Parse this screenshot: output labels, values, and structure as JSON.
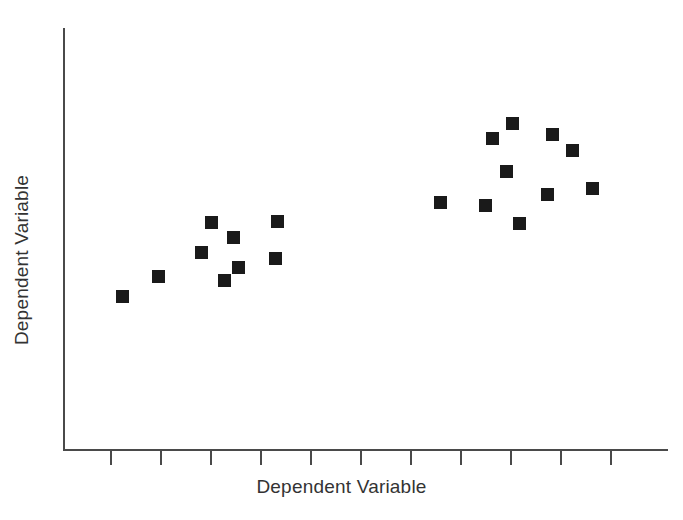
{
  "chart_data": {
    "type": "scatter",
    "title": "",
    "subtitle": "",
    "xlabel": "Dependent Variable",
    "ylabel": "Dependent Variable",
    "xlim": [
      0,
      12
    ],
    "ylim": [
      0,
      10
    ],
    "grid": false,
    "legend": null,
    "legend_position": "none",
    "x_tick_labels": [
      "",
      "",
      "",
      "",
      "",
      "",
      "",
      "",
      "",
      "",
      ""
    ],
    "y_tick_labels": [],
    "x_tick_positions_px": [
      110,
      160,
      210,
      260,
      310,
      360,
      410,
      460,
      510,
      560,
      610
    ],
    "marker": {
      "shape": "square",
      "color": "#1a1a1a",
      "size_px": 13
    },
    "axis": {
      "color": "#4a4a4a",
      "x_start_px": 63,
      "x_end_px": 668,
      "y_top_px": 28,
      "y_bottom_px": 450,
      "tick_length_px": 14,
      "ticks_on_y": false
    },
    "annotations": [],
    "clusters": [
      {
        "name": "left-cluster",
        "description": "lower-left group with rising trend",
        "count": 9
      },
      {
        "name": "right-cluster",
        "description": "upper-right group, higher and more scattered",
        "count": 10
      }
    ],
    "points": [
      {
        "id": "p1",
        "x_px": 122,
        "y_px": 296,
        "x": 1.1,
        "y": 3.65,
        "cluster": "left-cluster"
      },
      {
        "id": "p2",
        "x_px": 158,
        "y_px": 276,
        "x": 1.9,
        "y": 4.13,
        "cluster": "left-cluster"
      },
      {
        "id": "p3",
        "x_px": 201,
        "y_px": 252,
        "x": 2.85,
        "y": 4.7,
        "cluster": "left-cluster"
      },
      {
        "id": "p4",
        "x_px": 211,
        "y_px": 222,
        "x": 3.07,
        "y": 5.41,
        "cluster": "left-cluster"
      },
      {
        "id": "p5",
        "x_px": 233,
        "y_px": 237,
        "x": 3.56,
        "y": 5.05,
        "cluster": "left-cluster"
      },
      {
        "id": "p6",
        "x_px": 224,
        "y_px": 280,
        "x": 3.36,
        "y": 4.03,
        "cluster": "left-cluster"
      },
      {
        "id": "p7",
        "x_px": 238,
        "y_px": 267,
        "x": 3.67,
        "y": 4.34,
        "cluster": "left-cluster"
      },
      {
        "id": "p8",
        "x_px": 275,
        "y_px": 258,
        "x": 4.49,
        "y": 4.55,
        "cluster": "left-cluster"
      },
      {
        "id": "p9",
        "x_px": 277,
        "y_px": 221,
        "x": 4.53,
        "y": 5.43,
        "cluster": "left-cluster"
      },
      {
        "id": "p10",
        "x_px": 440,
        "y_px": 202,
        "x": 8.16,
        "y": 5.88,
        "cluster": "right-cluster"
      },
      {
        "id": "p11",
        "x_px": 485,
        "y_px": 205,
        "x": 9.16,
        "y": 5.81,
        "cluster": "right-cluster"
      },
      {
        "id": "p12",
        "x_px": 492,
        "y_px": 138,
        "x": 9.31,
        "y": 7.4,
        "cluster": "right-cluster"
      },
      {
        "id": "p13",
        "x_px": 512,
        "y_px": 123,
        "x": 9.76,
        "y": 7.75,
        "cluster": "right-cluster"
      },
      {
        "id": "p14",
        "x_px": 506,
        "y_px": 171,
        "x": 9.62,
        "y": 6.61,
        "cluster": "right-cluster"
      },
      {
        "id": "p15",
        "x_px": 519,
        "y_px": 223,
        "x": 9.91,
        "y": 5.38,
        "cluster": "right-cluster"
      },
      {
        "id": "p16",
        "x_px": 552,
        "y_px": 134,
        "x": 10.64,
        "y": 7.49,
        "cluster": "right-cluster"
      },
      {
        "id": "p17",
        "x_px": 572,
        "y_px": 150,
        "x": 11.09,
        "y": 7.11,
        "cluster": "right-cluster"
      },
      {
        "id": "p18",
        "x_px": 547,
        "y_px": 194,
        "x": 10.53,
        "y": 6.07,
        "cluster": "right-cluster"
      },
      {
        "id": "p19",
        "x_px": 592,
        "y_px": 188,
        "x": 11.53,
        "y": 6.21,
        "cluster": "right-cluster"
      }
    ]
  }
}
